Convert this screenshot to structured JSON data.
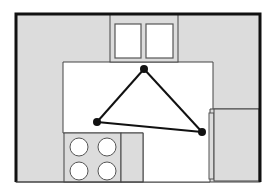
{
  "diagram": {
    "type": "kitchen-floor-plan",
    "colors": {
      "cabinet_fill": "#dcdcdc",
      "floor_fill": "#ffffff",
      "wall_stroke": "#111111",
      "line_stroke": "#444444",
      "triangle_color": "#111111"
    },
    "elements": {
      "sink": {
        "label": "sink",
        "basins": 2
      },
      "stove": {
        "label": "stove",
        "burners": 4
      },
      "refrigerator": {
        "label": "refrigerator"
      }
    },
    "work_triangle": {
      "vertices": [
        {
          "name": "sink-point",
          "x": 144,
          "y": 69
        },
        {
          "name": "stove-point",
          "x": 97,
          "y": 122
        },
        {
          "name": "fridge-point",
          "x": 202,
          "y": 132
        }
      ]
    }
  }
}
